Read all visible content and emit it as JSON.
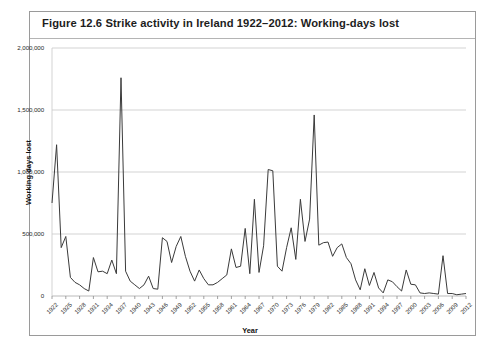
{
  "figure": {
    "title": "Figure 12.6  Strike activity in Ireland 1922–2012: Working-days lost",
    "border_color": "#9a9a9a",
    "background": "#ffffff"
  },
  "chart_data": {
    "type": "line",
    "title": "Strike activity in Ireland 1922–2012: Working-days lost",
    "xlabel": "Year",
    "ylabel": "Working days lost",
    "xlim": [
      1922,
      2012
    ],
    "ylim": [
      0,
      2000000
    ],
    "grid": true,
    "legend": null,
    "line_color": "#3a3a3a",
    "grid_color": "#c8c8c8",
    "ytick_labels": [
      "0",
      "500,000",
      "1,000,000",
      "1,500,000",
      "2,000,000"
    ],
    "ytick_values": [
      0,
      500000,
      1000000,
      1500000,
      2000000
    ],
    "xtick_labels": [
      "1922",
      "1925",
      "1928",
      "1931",
      "1934",
      "1937",
      "1940",
      "1943",
      "1946",
      "1949",
      "1952",
      "1955",
      "1958",
      "1961",
      "1964",
      "1967",
      "1970",
      "1973",
      "1976",
      "1979",
      "1982",
      "1985",
      "1988",
      "1991",
      "1994",
      "1997",
      "2000",
      "2003",
      "2006",
      "2009",
      "2012"
    ],
    "xtick_values": [
      1922,
      1925,
      1928,
      1931,
      1934,
      1937,
      1940,
      1943,
      1946,
      1949,
      1952,
      1955,
      1958,
      1961,
      1964,
      1967,
      1970,
      1973,
      1976,
      1979,
      1982,
      1985,
      1988,
      1991,
      1994,
      1997,
      2000,
      2003,
      2006,
      2009,
      2012
    ],
    "x": [
      1922,
      1923,
      1924,
      1925,
      1926,
      1927,
      1928,
      1929,
      1930,
      1931,
      1932,
      1933,
      1934,
      1935,
      1936,
      1937,
      1938,
      1939,
      1940,
      1941,
      1942,
      1943,
      1944,
      1945,
      1946,
      1947,
      1948,
      1949,
      1950,
      1951,
      1952,
      1953,
      1954,
      1955,
      1956,
      1957,
      1958,
      1959,
      1960,
      1961,
      1962,
      1963,
      1964,
      1965,
      1966,
      1967,
      1968,
      1969,
      1970,
      1971,
      1972,
      1973,
      1974,
      1975,
      1976,
      1977,
      1978,
      1979,
      1980,
      1981,
      1982,
      1983,
      1984,
      1985,
      1986,
      1987,
      1988,
      1989,
      1990,
      1991,
      1992,
      1993,
      1994,
      1995,
      1996,
      1997,
      1998,
      1999,
      2000,
      2001,
      2002,
      2003,
      2004,
      2005,
      2006,
      2007,
      2008,
      2009,
      2010,
      2011,
      2012
    ],
    "values": [
      750000,
      1220000,
      390000,
      480000,
      150000,
      110000,
      90000,
      60000,
      40000,
      310000,
      195000,
      200000,
      180000,
      290000,
      180000,
      1760000,
      200000,
      120000,
      90000,
      60000,
      90000,
      160000,
      60000,
      55000,
      470000,
      440000,
      270000,
      400000,
      480000,
      320000,
      200000,
      120000,
      210000,
      140000,
      90000,
      90000,
      110000,
      140000,
      170000,
      380000,
      230000,
      240000,
      545000,
      180000,
      780000,
      190000,
      405000,
      1020000,
      1010000,
      240000,
      200000,
      390000,
      550000,
      295000,
      780000,
      440000,
      620000,
      1460000,
      410000,
      430000,
      435000,
      320000,
      390000,
      420000,
      310000,
      260000,
      130000,
      50000,
      220000,
      85000,
      190000,
      65000,
      25000,
      130000,
      115000,
      75000,
      40000,
      210000,
      95000,
      90000,
      25000,
      20000,
      25000,
      20000,
      15000,
      325000,
      20000,
      20000,
      10000,
      15000,
      20000
    ]
  }
}
